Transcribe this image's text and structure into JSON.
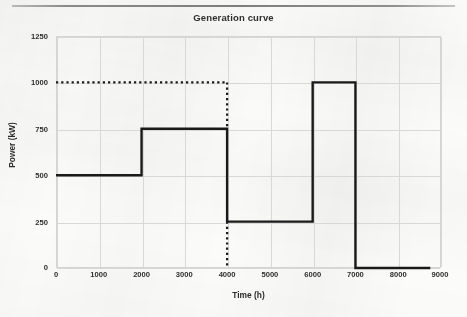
{
  "figure": {
    "title": "Generation curve",
    "rule_color": "#7d7d7d",
    "background": "#fbfbfa"
  },
  "chart_data": {
    "type": "line",
    "title": "Generation curve",
    "xlabel": "Time (h)",
    "ylabel": "Power (kW)",
    "xlim": [
      0,
      9000
    ],
    "ylim": [
      0,
      1250
    ],
    "xticks": [
      0,
      1000,
      2000,
      3000,
      4000,
      5000,
      6000,
      7000,
      8000,
      9000
    ],
    "yticks": [
      0,
      250,
      500,
      750,
      1000,
      1250
    ],
    "xtick_labels": [
      "0",
      "1000",
      "2000",
      "3000",
      "4000",
      "5000",
      "6000",
      "7000",
      "8000",
      "9000"
    ],
    "ytick_labels": [
      "0",
      "250",
      "500",
      "750",
      "1000",
      "1250"
    ],
    "grid": true,
    "legend": null,
    "series": [
      {
        "name": "Generation curve",
        "style": "solid",
        "color": "#1a1a1a",
        "linewidth": 2.4,
        "drawstyle": "steps-post",
        "x": [
          0,
          2000,
          2000,
          4000,
          4000,
          6000,
          6000,
          7000,
          7000,
          8750
        ],
        "y": [
          500,
          500,
          750,
          750,
          250,
          250,
          1000,
          1000,
          0,
          0
        ],
        "steps": [
          {
            "from_h": 0,
            "to_h": 2000,
            "power_kw": 500
          },
          {
            "from_h": 2000,
            "to_h": 4000,
            "power_kw": 750
          },
          {
            "from_h": 4000,
            "to_h": 6000,
            "power_kw": 250
          },
          {
            "from_h": 6000,
            "to_h": 7000,
            "power_kw": 1000
          },
          {
            "from_h": 7000,
            "to_h": 8750,
            "power_kw": 0
          }
        ]
      },
      {
        "name": "Rated power reference",
        "style": "dotted",
        "color": "#1a1a1a",
        "linewidth": 2.2,
        "segments": [
          {
            "orientation": "horizontal",
            "power_kw": 1000,
            "from_h": 0,
            "to_h": 4000
          },
          {
            "orientation": "vertical",
            "time_h": 4000,
            "from_kw": 1000,
            "to_kw": 750
          },
          {
            "orientation": "vertical",
            "time_h": 4000,
            "from_kw": 250,
            "to_kw": 0
          }
        ]
      }
    ],
    "annotations": []
  },
  "axes": {
    "x_title": "Time (h)",
    "y_title": "Power (kW)"
  }
}
